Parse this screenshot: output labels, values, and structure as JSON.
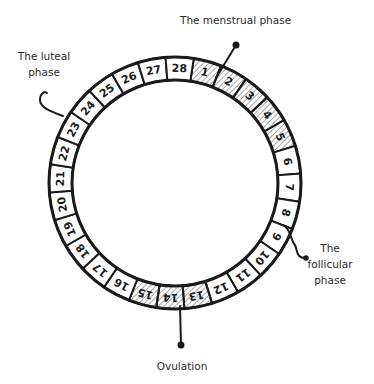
{
  "diagram": {
    "total_days": 28,
    "start_angle_deg": 15,
    "center": [
      175,
      183
    ],
    "outer_radius": 126,
    "inner_radius": 103,
    "days": [
      "1",
      "2",
      "3",
      "4",
      "5",
      "6",
      "7",
      "8",
      "9",
      "10",
      "11",
      "12",
      "13",
      "14",
      "15",
      "16",
      "17",
      "18",
      "19",
      "20",
      "21",
      "22",
      "23",
      "24",
      "25",
      "26",
      "27",
      "28"
    ],
    "hatched_days": [
      1,
      2,
      3,
      4,
      5,
      13,
      14,
      15
    ],
    "colors": {
      "stroke": "#1a1a1a",
      "text": "#2a2a2a",
      "hatch": "#555555",
      "background": "#ffffff"
    }
  },
  "labels": {
    "menstrual": {
      "lines": [
        "The menstrual phase"
      ],
      "days": "1-5"
    },
    "luteal": {
      "lines": [
        "The luteal",
        "phase"
      ]
    },
    "follicular": {
      "lines": [
        "The",
        "follicular",
        "phase"
      ]
    },
    "ovulation": {
      "lines": [
        "Ovulation"
      ],
      "days": "13-15"
    }
  }
}
